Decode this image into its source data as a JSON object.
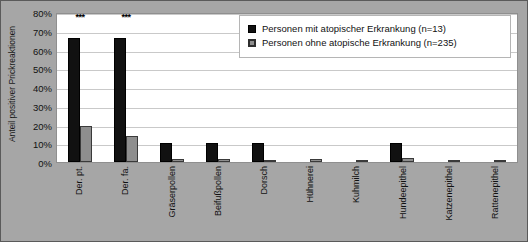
{
  "chart_data": {
    "type": "bar",
    "title": "",
    "xlabel": "",
    "ylabel": "Anteil positiver Prickreaktionen",
    "ylim": [
      0,
      80
    ],
    "ytick_labels": [
      "80%",
      "70%",
      "60%",
      "50%",
      "40%",
      "30%",
      "20%",
      "10%",
      "0%"
    ],
    "ytick_values": [
      80,
      70,
      60,
      50,
      40,
      30,
      20,
      10,
      0
    ],
    "grid": true,
    "legend_position": "top-right",
    "categories": [
      "Der. pt.",
      "Der. fa.",
      "Gräserpollen",
      "Beifußpollen",
      "Dorsch",
      "Hühnerei",
      "Kuhmilch",
      "Hundeepithel",
      "Katzenepithel",
      "Rattenepithel"
    ],
    "series": [
      {
        "name": "Personen mit atopischer Erkrankung (n=13)",
        "color": "#111111",
        "values": [
          66,
          66,
          10,
          10,
          10,
          0,
          0,
          10,
          0,
          0
        ]
      },
      {
        "name": "Personen ohne atopische Erkrankung (n=235)",
        "color": "#8e8e8e",
        "values": [
          19,
          14,
          1.5,
          1.5,
          1,
          1.5,
          1,
          2,
          1,
          1
        ]
      }
    ],
    "annotations": [
      {
        "category": "Der. pt.",
        "text": "***"
      },
      {
        "category": "Der. fa.",
        "text": "***"
      }
    ]
  },
  "legend": {
    "items": [
      {
        "label": "Personen mit atopischer Erkrankung (n=13)",
        "swatch": "black-square-icon"
      },
      {
        "label": "Personen ohne atopische Erkrankung (n=235)",
        "swatch": "gray-square-icon"
      }
    ]
  },
  "colors": {
    "figure_background": "#a6a6a6",
    "plot_background": "#ffffff",
    "gridline": "#c9c9c9",
    "series_atopic": "#111111",
    "series_nonatopic": "#8e8e8e",
    "text": "#111111"
  }
}
